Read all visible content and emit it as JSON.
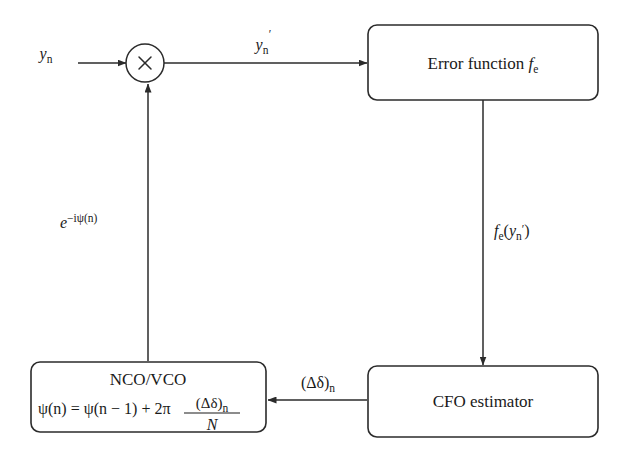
{
  "figure": {
    "type": "block-diagram",
    "background_color": "#ffffff",
    "line_color": "#2b2b2b",
    "text_color": "#1a1a1a"
  },
  "nodes": {
    "multiplier": {
      "name": "multiplier",
      "symbol": "×",
      "shape": "circle"
    },
    "error_function": {
      "name": "error-function",
      "label_main": "Error function",
      "label_symbol_base": "f",
      "label_symbol_sub": "e",
      "shape": "rounded-rect"
    },
    "cfo_estimator": {
      "name": "cfo-estimator",
      "label": "CFO estimator",
      "shape": "rounded-rect"
    },
    "nco_vco": {
      "name": "nco-vco",
      "title": "NCO/VCO",
      "formula_lhs": "ψ(n) = ψ(n − 1) + 2π",
      "formula_numerator_base": "(Δδ)",
      "formula_numerator_sub": "n",
      "formula_denominator": "N",
      "shape": "rounded-rect"
    }
  },
  "edges": {
    "input": {
      "name": "input-signal",
      "label_base": "y",
      "label_sub": "n",
      "direction": "right"
    },
    "corrected": {
      "name": "corrected-signal",
      "label_base": "y",
      "label_prime": "′",
      "label_sub": "n",
      "direction": "right"
    },
    "error_out": {
      "name": "error-function-output",
      "label_base": "f",
      "label_sub": "e",
      "label_arg_open": "(",
      "label_arg_base": "y",
      "label_arg_sub": "n",
      "label_arg_prime": "′",
      "label_arg_close": ")",
      "direction": "down"
    },
    "cfo_out": {
      "name": "cfo-estimate",
      "label_base": "(Δδ)",
      "label_sub": "n",
      "direction": "left"
    },
    "phasor": {
      "name": "phase-correction",
      "label_base": "e",
      "label_exp_minus": "−",
      "label_exp_i": "i",
      "label_exp_psi": "ψ(n)",
      "direction": "up"
    }
  }
}
